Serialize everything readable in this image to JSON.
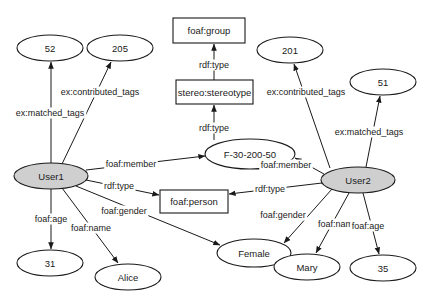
{
  "diagram": {
    "colors": {
      "stroke": "#1a1a1a",
      "user_fill": "#cfcfcf",
      "node_fill": "#ffffff"
    },
    "nodes": [
      {
        "id": "n52",
        "label": "52",
        "shape": "ellipse",
        "cx": 50,
        "cy": 48,
        "rx": 33,
        "ry": 13,
        "filled": false
      },
      {
        "id": "n205",
        "label": "205",
        "shape": "ellipse",
        "cx": 120,
        "cy": 48,
        "rx": 33,
        "ry": 13,
        "filled": false
      },
      {
        "id": "foaf_group",
        "label": "foaf:group",
        "shape": "rect",
        "x": 173,
        "y": 18,
        "w": 72,
        "h": 25
      },
      {
        "id": "stereo_stereotype",
        "label": "stereo:stereotype",
        "shape": "rect",
        "x": 176,
        "y": 80,
        "w": 77,
        "h": 24
      },
      {
        "id": "n201",
        "label": "201",
        "shape": "ellipse",
        "cx": 290,
        "cy": 50,
        "rx": 33,
        "ry": 13,
        "filled": false
      },
      {
        "id": "n51",
        "label": "51",
        "shape": "ellipse",
        "cx": 383,
        "cy": 82,
        "rx": 33,
        "ry": 13,
        "filled": false
      },
      {
        "id": "f30",
        "label": "F-30-200-50",
        "shape": "ellipse",
        "cx": 250,
        "cy": 154,
        "rx": 45,
        "ry": 15,
        "filled": false
      },
      {
        "id": "user1",
        "label": "User1",
        "shape": "ellipse",
        "cx": 51,
        "cy": 176,
        "rx": 37,
        "ry": 13,
        "filled": true
      },
      {
        "id": "user2",
        "label": "User2",
        "shape": "ellipse",
        "cx": 358,
        "cy": 180,
        "rx": 37,
        "ry": 13,
        "filled": true
      },
      {
        "id": "foaf_person",
        "label": "foaf:person",
        "shape": "rect",
        "x": 160,
        "y": 190,
        "w": 68,
        "h": 23
      },
      {
        "id": "female",
        "label": "Female",
        "shape": "ellipse",
        "cx": 254,
        "cy": 253,
        "rx": 37,
        "ry": 14,
        "filled": false
      },
      {
        "id": "n31",
        "label": "31",
        "shape": "ellipse",
        "cx": 50,
        "cy": 263,
        "rx": 33,
        "ry": 13,
        "filled": false
      },
      {
        "id": "alice",
        "label": "Alice",
        "shape": "ellipse",
        "cx": 128,
        "cy": 277,
        "rx": 33,
        "ry": 13,
        "filled": false
      },
      {
        "id": "mary",
        "label": "Mary",
        "shape": "ellipse",
        "cx": 307,
        "cy": 267,
        "rx": 33,
        "ry": 13,
        "filled": false
      },
      {
        "id": "n35",
        "label": "35",
        "shape": "ellipse",
        "cx": 383,
        "cy": 268,
        "rx": 33,
        "ry": 13,
        "filled": false
      }
    ],
    "edges": [
      {
        "from": "user1",
        "to": "n52",
        "label": "ex:matched_tags",
        "x1": 51,
        "y1": 163,
        "x2": 51,
        "y2": 62,
        "lx": 50,
        "ly": 113
      },
      {
        "from": "user1",
        "to": "n205",
        "label": "ex:contributed_tags",
        "x1": 62,
        "y1": 164,
        "x2": 111,
        "y2": 62,
        "lx": 100,
        "ly": 92
      },
      {
        "from": "user1",
        "to": "f30",
        "label": "foaf:member",
        "x1": 86,
        "y1": 170,
        "x2": 205,
        "y2": 156,
        "lx": 131,
        "ly": 164
      },
      {
        "from": "user1",
        "to": "foaf_person",
        "label": "rdf:type",
        "x1": 86,
        "y1": 180,
        "x2": 159,
        "y2": 195,
        "lx": 119,
        "ly": 186
      },
      {
        "from": "user1",
        "to": "female",
        "label": "foaf:gender",
        "x1": 76,
        "y1": 186,
        "x2": 220,
        "y2": 245,
        "lx": 124,
        "ly": 211
      },
      {
        "from": "user1",
        "to": "n31",
        "label": "foaf:age",
        "x1": 51,
        "y1": 189,
        "x2": 51,
        "y2": 249,
        "lx": 51,
        "ly": 219
      },
      {
        "from": "user1",
        "to": "alice",
        "label": "foaf:name",
        "x1": 62,
        "y1": 188,
        "x2": 118,
        "y2": 263,
        "lx": 91,
        "ly": 228
      },
      {
        "from": "foaf_group_src",
        "to": "foaf_group",
        "label": "rdf:type",
        "x1": 214,
        "y1": 80,
        "x2": 214,
        "y2": 44,
        "lx": 214,
        "ly": 65
      },
      {
        "from": "f30",
        "to": "stereo_stereotype",
        "label": "rdf:type",
        "x1": 214,
        "y1": 140,
        "x2": 214,
        "y2": 105,
        "lx": 214,
        "ly": 128
      },
      {
        "from": "user2",
        "to": "n201",
        "label": "ex:contributed_tags",
        "x1": 330,
        "y1": 168,
        "x2": 294,
        "y2": 64,
        "lx": 306,
        "ly": 92
      },
      {
        "from": "user2",
        "to": "n51",
        "label": "ex:matched_tags",
        "x1": 366,
        "y1": 167,
        "x2": 380,
        "y2": 96,
        "lx": 369,
        "ly": 132
      },
      {
        "from": "user2",
        "to": "f30",
        "label": "foaf:member",
        "x1": 324,
        "y1": 174,
        "x2": 295,
        "y2": 158,
        "lx": 286,
        "ly": 165
      },
      {
        "from": "user2",
        "to": "foaf_person",
        "label": "rdf:type",
        "x1": 322,
        "y1": 183,
        "x2": 229,
        "y2": 194,
        "lx": 270,
        "ly": 189
      },
      {
        "from": "user2",
        "to": "female",
        "label": "foaf:gender",
        "x1": 332,
        "y1": 189,
        "x2": 284,
        "y2": 243,
        "lx": 283,
        "ly": 215
      },
      {
        "from": "user2",
        "to": "mary",
        "label": "foaf:name",
        "x1": 349,
        "y1": 193,
        "x2": 316,
        "y2": 253,
        "lx": 338,
        "ly": 224
      },
      {
        "from": "user2",
        "to": "n35",
        "label": "foaf:age",
        "x1": 363,
        "y1": 193,
        "x2": 379,
        "y2": 254,
        "lx": 368,
        "ly": 226
      }
    ]
  }
}
